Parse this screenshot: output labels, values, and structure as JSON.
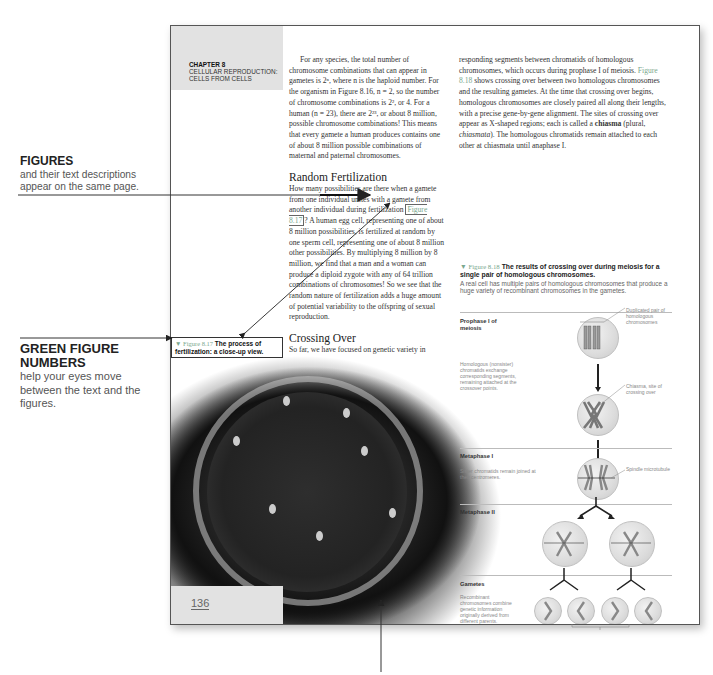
{
  "annotations": {
    "figures": {
      "heading": "FIGURES",
      "body": "and their text descriptions appear on the same page."
    },
    "green_numbers": {
      "heading": "GREEN FIGURE NUMBERS",
      "body": "help your eyes move between the text and the figures."
    }
  },
  "page": {
    "chapter": {
      "number": "CHAPTER 8",
      "title_line1": "CELLULAR REPRODUCTION:",
      "title_line2": "CELLS FROM CELLS"
    },
    "page_number": "136",
    "col1": {
      "para1": "For any species, the total number of chromosome combinations that can appear in gametes is 2ⁿ, where n is the haploid number. For the organism in Figure 8.16, n = 2, so the number of chromosome combinations is 2², or 4. For a human (n = 23), there are 2²³, or about 8 million, possible chromosome combinations! This means that every gamete a human produces contains one of about 8 million possible combinations of maternal and paternal chromosomes.",
      "heading_random": "Random Fertilization",
      "para2_before": "How many possibilities are there when a gamete from one individual unites with a gamete from another individual during fertilization",
      "para2_figref": "Figure 8.17",
      "para2_after": "? A human egg cell, representing one of about 8 million possibilities, is fertilized at random by one sperm cell, representing one of about 8 million other possibilities. By multiplying 8 million by 8 million, we find that a man and a woman can produce a diploid zygote with any of 64 trillion combinations of chromosomes! So we see that the random nature of fertilization adds a huge amount of potential variability to the offspring of sexual reproduction.",
      "heading_crossing": "Crossing Over",
      "para3_before": "So far, we have focused on genetic variety in gametes and zygotes at the whole-chromosome level. We'll now take a closer look at ",
      "para3_bold": "crossing over",
      "para3_after": ", the exchange of cor-"
    },
    "col2": {
      "para_before": "responding segments between chromatids of homologous chromosomes, which occurs during prophase I of meiosis. ",
      "figref": "Figure 8.18",
      "para_mid": " shows crossing over between two homologous chromosomes and the resulting gametes. At the time that crossing over begins, homologous chromosomes are closely paired all along their lengths, with a precise gene-by-gene alignment. The sites of crossing over appear as X-shaped regions; each is called a ",
      "bold": "chiasma",
      "para_paren_open": " (plural, ",
      "italic": "chiasmata",
      "para_end": "). The homologous chromatids remain attached to each other at chiasmata until anaphase I."
    },
    "fig17": {
      "number": "▼ Figure 8.17",
      "caption": "The process of fertilization: a close-up view."
    },
    "fig18": {
      "number": "▼ Figure 8.18",
      "title": "The results of crossing over during meiosis for a single pair of homologous chromosomes.",
      "desc": "A real cell has multiple pairs of homologous chromosomes that produce a huge variety of recombinant chromosomes in the gametes.",
      "stages": {
        "prophase": "Prophase I of meiosis",
        "metaphase1": "Metaphase I",
        "metaphase2": "Metaphase II",
        "gametes": "Gametes"
      },
      "notes": {
        "homologous": "Homologous (nonsister) chromatids exchange corresponding segments, remaining attached at the crossover points.",
        "sister": "Sister chromatids remain joined at their centromeres.",
        "recombinant": "Recombinant chromosomes combine genetic information originally derived from different parents."
      },
      "callouts": {
        "duplicated": "Duplicated pair of homologous chromosomes",
        "chiasma": "Chiasma, site of crossing over",
        "spindle": "Spindle microtubule",
        "recombinant": "Recombinant chromosomes"
      }
    }
  },
  "colors": {
    "green_figure_number": "#7aa88e",
    "chapter_box": "#e2e2e2"
  }
}
